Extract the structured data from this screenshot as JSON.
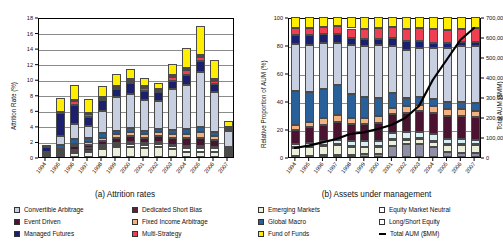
{
  "figure": {
    "left_caption": "(a) Attrition rates",
    "right_caption": "(b) Assets under management"
  },
  "legend": {
    "left": [
      {
        "label": "Convertible Arbitrage",
        "color": "#c7cfe0"
      },
      {
        "label": "Dedicated Short Bias",
        "color": "#5b2530"
      },
      {
        "label": "Event Driven",
        "color": "#4a1430"
      },
      {
        "label": "Fixed Income Arbitrage",
        "color": "#f2b183"
      },
      {
        "label": "Managed Futures",
        "color": "#1b1f70"
      },
      {
        "label": "Multi-Strategy",
        "color": "#ef3f52"
      }
    ],
    "right": [
      {
        "label": "Emerging Markets",
        "color": "#ecefd9"
      },
      {
        "label": "Equity Market Neutral",
        "color": "#ffffff"
      },
      {
        "label": "Global Macro",
        "color": "#2a6099"
      },
      {
        "label": "Long/Short Equity",
        "color": "#ffffff"
      },
      {
        "label": "Fund of Funds",
        "color": "#ffee00"
      },
      {
        "label": "Total AUM ($MM)",
        "color": "#000000",
        "type": "line"
      }
    ]
  },
  "chart_data": [
    {
      "type": "bar",
      "id": "attrition",
      "title": "(a) Attrition rates",
      "stacked": true,
      "grid": true,
      "legend_position": "below",
      "xlabel": "",
      "ylabel": "Attrition Rate (%)",
      "ylim": [
        0,
        18
      ],
      "yticks": [
        0,
        2,
        4,
        6,
        8,
        10,
        12,
        14,
        16,
        18
      ],
      "ytick_labels": [
        "0",
        "2",
        "4",
        "6",
        "8",
        "10",
        "12",
        "14",
        "16",
        "18"
      ],
      "categories": [
        "1994",
        "1995",
        "1996",
        "1997",
        "1998",
        "1999",
        "2000",
        "2001",
        "2002",
        "2003",
        "2004",
        "2005",
        "2006",
        "2007"
      ],
      "series": [
        {
          "name": "Emerging Markets",
          "color": "#ecefd9",
          "values": [
            0.0,
            0.2,
            0.5,
            0.6,
            1.0,
            1.3,
            1.3,
            1.2,
            1.3,
            1.0,
            0.7,
            0.6,
            0.6,
            0.3
          ]
        },
        {
          "name": "Equity Market Neutral",
          "color": "#ffffff",
          "values": [
            0.0,
            0.1,
            0.2,
            0.2,
            0.3,
            0.3,
            0.4,
            0.4,
            0.4,
            0.4,
            0.5,
            0.6,
            0.5,
            0.2
          ]
        },
        {
          "name": "Dedicated Short Bias",
          "color": "#5b2530",
          "values": [
            0.1,
            0.2,
            0.2,
            0.3,
            0.2,
            0.2,
            0.2,
            0.2,
            0.2,
            0.2,
            0.2,
            0.2,
            0.2,
            0.1
          ]
        },
        {
          "name": "Event Driven",
          "color": "#4a1430",
          "values": [
            0.1,
            0.3,
            0.5,
            0.5,
            0.6,
            0.7,
            0.8,
            0.7,
            0.8,
            0.9,
            1.0,
            1.1,
            0.9,
            0.3
          ]
        },
        {
          "name": "Fixed Income Arbitrage",
          "color": "#f2b183",
          "values": [
            0.1,
            0.2,
            0.3,
            0.3,
            0.4,
            0.4,
            0.5,
            0.4,
            0.5,
            0.5,
            0.6,
            0.7,
            0.5,
            0.2
          ]
        },
        {
          "name": "Global Macro",
          "color": "#2a6099",
          "values": [
            0.2,
            0.5,
            0.6,
            0.5,
            0.6,
            0.5,
            0.5,
            0.4,
            0.4,
            0.5,
            0.6,
            0.7,
            0.5,
            0.2
          ]
        },
        {
          "name": "Convertible Arbitrage",
          "color": "#c7cfe0",
          "values": [
            0.2,
            1.2,
            2.0,
            1.6,
            2.8,
            4.3,
            4.4,
            4.0,
            3.6,
            5.2,
            5.6,
            7.0,
            5.2,
            2.0
          ]
        },
        {
          "name": "Managed Futures",
          "color": "#1b1f70",
          "values": [
            0.6,
            2.9,
            2.4,
            1.1,
            1.4,
            1.0,
            1.4,
            1.2,
            1.1,
            1.1,
            1.4,
            1.4,
            1.0,
            0.3
          ]
        },
        {
          "name": "Multi-Strategy",
          "color": "#ef3f52",
          "values": [
            0.0,
            0.1,
            0.5,
            0.4,
            0.2,
            0.2,
            0.3,
            0.4,
            0.2,
            0.5,
            0.6,
            0.5,
            0.4,
            0.1
          ]
        },
        {
          "name": "Long/Short Equity",
          "color": "#ffffff",
          "values": [
            0.0,
            0.1,
            0.1,
            0.2,
            0.2,
            0.2,
            0.2,
            0.2,
            0.2,
            0.2,
            0.3,
            0.3,
            0.2,
            0.1
          ]
        },
        {
          "name": "Fund of Funds",
          "color": "#ffee00",
          "values": [
            0.3,
            1.8,
            2.0,
            1.7,
            1.4,
            1.6,
            1.3,
            1.0,
            0.8,
            1.4,
            2.5,
            3.8,
            2.5,
            0.8
          ]
        }
      ]
    },
    {
      "type": "bar",
      "id": "aum",
      "title": "(b) Assets under management",
      "stacked": true,
      "stack_mode": "percent",
      "grid": true,
      "legend_position": "below",
      "xlabel": "",
      "ylabel": "Relative Proportion of AUM (%)",
      "ylim": [
        0,
        100
      ],
      "yticks": [
        0,
        20,
        40,
        60,
        80,
        100
      ],
      "ytick_labels": [
        "0",
        "20",
        "40",
        "60",
        "80",
        "100"
      ],
      "y2label": "Total AUM ($MM)",
      "y2lim": [
        0,
        700000
      ],
      "y2ticks": [
        0,
        100000,
        200000,
        300000,
        400000,
        500000,
        600000,
        700000
      ],
      "y2tick_labels": [
        "0",
        "100,000",
        "200,000",
        "300,000",
        "400,000",
        "500,000",
        "600,000",
        "700,000"
      ],
      "categories": [
        "1994",
        "1995",
        "1996",
        "1997",
        "1998",
        "1999",
        "2000",
        "2001",
        "2002",
        "2003",
        "2004",
        "2005",
        "2006",
        "2007"
      ],
      "series": [
        {
          "name": "Multi-Strategy",
          "color": "#8f8fa8",
          "values": [
            1.0,
            1.0,
            1.2,
            1.4,
            1.6,
            1.8,
            2.4,
            8.0,
            9.0,
            9.5,
            7.0,
            3.5,
            3.2,
            3.0
          ]
        },
        {
          "name": "Emerging Markets",
          "color": "#ecefd9",
          "values": [
            5.5,
            6.0,
            6.5,
            7.0,
            5.5,
            5.0,
            4.5,
            4.0,
            3.5,
            3.5,
            4.0,
            5.0,
            5.5,
            5.5
          ]
        },
        {
          "name": "Dedicated Short Bias",
          "color": "#5b2530",
          "values": [
            1.0,
            1.0,
            0.9,
            0.8,
            0.8,
            0.7,
            0.7,
            0.7,
            0.7,
            0.6,
            0.6,
            0.5,
            0.5,
            0.5
          ]
        },
        {
          "name": "Equity Market Neutral",
          "color": "#d7eef4",
          "values": [
            2.0,
            2.2,
            2.6,
            3.0,
            3.4,
            3.6,
            4.0,
            4.2,
            4.5,
            4.5,
            4.5,
            4.0,
            3.8,
            3.5
          ]
        },
        {
          "name": "Event Driven",
          "color": "#4a1430",
          "values": [
            10.0,
            11.0,
            12.0,
            12.5,
            12.0,
            12.5,
            13.0,
            13.5,
            14.0,
            14.5,
            15.5,
            16.5,
            16.5,
            16.0
          ]
        },
        {
          "name": "Fixed Income Arbitrage",
          "color": "#f2b183",
          "values": [
            3.5,
            4.0,
            4.5,
            5.0,
            4.5,
            4.5,
            4.5,
            4.5,
            4.5,
            4.5,
            4.5,
            4.5,
            4.5,
            4.5
          ]
        },
        {
          "name": "Global Macro",
          "color": "#2a6099",
          "values": [
            24.0,
            21.0,
            21.0,
            21.5,
            17.5,
            15.0,
            13.0,
            10.5,
            6.0,
            5.5,
            5.5,
            5.0,
            5.0,
            5.5
          ]
        },
        {
          "name": "Long/Short Equity",
          "color": "#c7cfe0",
          "values": [
            33.5,
            33.5,
            32.5,
            30.5,
            34.5,
            36.5,
            38.0,
            34.0,
            34.5,
            35.0,
            36.0,
            39.0,
            40.0,
            41.0
          ]
        },
        {
          "name": "Managed Futures",
          "color": "#1b1f70",
          "values": [
            7.0,
            7.5,
            6.5,
            6.0,
            5.5,
            5.0,
            4.5,
            5.5,
            6.5,
            5.5,
            4.0,
            3.5,
            3.0,
            3.0
          ]
        },
        {
          "name": "Multi-Strategy 2",
          "color": "#ef3f52",
          "values": [
            5.0,
            5.0,
            5.5,
            6.0,
            6.5,
            7.0,
            7.5,
            8.0,
            8.5,
            9.0,
            9.5,
            9.5,
            9.5,
            9.5
          ]
        },
        {
          "name": "Fund of Funds",
          "color": "#ffee00",
          "values": [
            7.5,
            7.8,
            6.8,
            6.3,
            8.2,
            8.4,
            7.9,
            7.1,
            8.3,
            7.9,
            8.9,
            9.0,
            8.5,
            8.0
          ]
        }
      ],
      "line_series": {
        "name": "Total AUM ($MM)",
        "color": "#000000",
        "axis": "right",
        "values": [
          50000,
          62000,
          78000,
          95000,
          120000,
          128000,
          145000,
          165000,
          200000,
          260000,
          390000,
          490000,
          590000,
          650000
        ]
      }
    }
  ]
}
